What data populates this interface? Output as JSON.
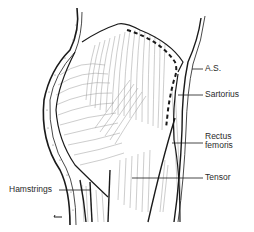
{
  "diagram": {
    "colors": {
      "ink": "#1a1a1a",
      "hatch": "#8a8a8a",
      "background": "#ffffff"
    },
    "labels": [
      {
        "id": "as",
        "text": "A.S."
      },
      {
        "id": "sartorius",
        "text": "Sartorius"
      },
      {
        "id": "rectus",
        "line1": "Rectus",
        "line2": "femoris"
      },
      {
        "id": "tensor",
        "text": "Tensor"
      },
      {
        "id": "hamstrings",
        "text": "Hamstrings"
      }
    ]
  }
}
